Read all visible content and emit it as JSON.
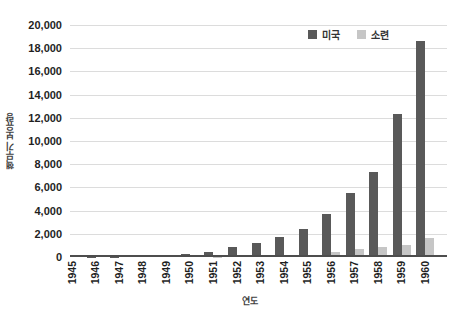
{
  "chart_data": {
    "type": "bar",
    "title": "",
    "categories": [
      "1945",
      "1946",
      "1947",
      "1948",
      "1949",
      "1950",
      "1951",
      "1952",
      "1953",
      "1954",
      "1955",
      "1956",
      "1957",
      "1958",
      "1959",
      "1960"
    ],
    "series": [
      {
        "name": "미국",
        "color": "#595959",
        "values": [
          2,
          9,
          13,
          50,
          170,
          299,
          438,
          841,
          1169,
          1703,
          2422,
          3692,
          5543,
          7345,
          12298,
          18638
        ]
      },
      {
        "name": "소련",
        "color": "#c6c6c6",
        "values": [
          0,
          0,
          0,
          0,
          1,
          5,
          25,
          50,
          120,
          150,
          200,
          426,
          660,
          869,
          1060,
          1605
        ]
      }
    ],
    "xlabel": "연도",
    "ylabel": "핵무기 보유량",
    "ylim": [
      0,
      20000
    ],
    "ytick_step": 2000,
    "ytick_labels": [
      "0",
      "2,000",
      "4,000",
      "6,000",
      "8,000",
      "10,000",
      "12,000",
      "14,000",
      "16,000",
      "18,000",
      "20,000"
    ],
    "grid": true,
    "legend_position": "top-right",
    "gridline_color": "#dcdcdc",
    "axis_color": "#4d4d4d",
    "text_color": "#1f1f1f"
  }
}
